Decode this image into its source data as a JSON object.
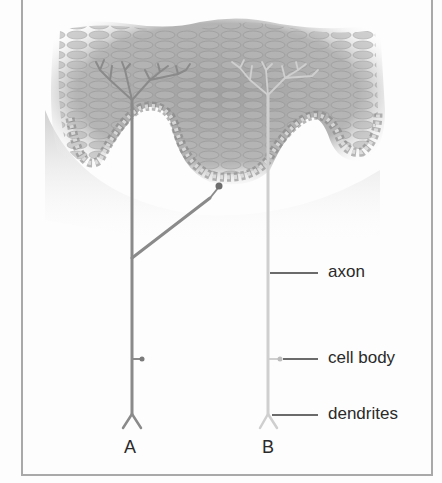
{
  "diagram": {
    "type": "anatomical illustration",
    "neurons": [
      {
        "id": "A",
        "label": "A",
        "color": "#8a8a8a",
        "description": "darker neuron with branched endings and a side branch to a receptor"
      },
      {
        "id": "B",
        "label": "B",
        "color": "#cfcfcf",
        "description": "lighter neuron with fine branched endings"
      }
    ],
    "labels": {
      "axon": "axon",
      "cell_body": "cell body",
      "dendrites": "dendrites"
    },
    "colors": {
      "frame": "#a9a9a9",
      "skin_dark": "#9a9a9a",
      "skin_light": "#c8c8c8",
      "neuron_a": "#8a8a8a",
      "neuron_b": "#cfcfcf",
      "leader_line": "#3a3a3a"
    }
  }
}
